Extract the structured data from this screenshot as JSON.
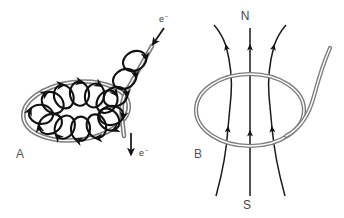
{
  "figure": {
    "width": 344,
    "height": 218,
    "background": "#ffffff"
  },
  "colors": {
    "wire": "#9a9a9a",
    "wire_edge": "#7d7d7d",
    "field_arrow": "#111111",
    "field_line": "#1a1a1a",
    "label": "#3a3a3a"
  },
  "panels": [
    {
      "id": "A",
      "label": "A",
      "label_x": 16,
      "label_y": 158,
      "caption_role": "current-loop-with-circular-magnetic-field",
      "wire": {
        "shape": "loop-with-diagonal-lead",
        "style": "double-line-tube",
        "color": "#9a9a9a"
      },
      "annotations": [
        {
          "name": "electron-inflow",
          "text": "e",
          "superscript": "−",
          "text_x": 160,
          "text_y": 22,
          "arrow": "diagonal-down-left",
          "arrow_from": [
            163,
            30
          ],
          "arrow_to": [
            152,
            45
          ]
        },
        {
          "name": "electron-outflow",
          "text": "e",
          "superscript": "−",
          "text_x": 141,
          "text_y": 156,
          "arrow": "straight-down",
          "arrow_from": [
            131,
            132
          ],
          "arrow_to": [
            131,
            155
          ]
        }
      ],
      "field_rings": {
        "count": 14,
        "style": "elliptical-arrow-loops-encircling-wire",
        "color": "#111111"
      }
    },
    {
      "id": "B",
      "label": "B",
      "label_x": 196,
      "label_y": 158,
      "caption_role": "equivalent-magnetic-dipole-field",
      "wire": {
        "shape": "ellipse-loop-with-lead",
        "style": "double-line-tube",
        "color": "#9a9a9a"
      },
      "poles": [
        {
          "name": "north-pole",
          "label": "N",
          "x": 250,
          "y": 20
        },
        {
          "name": "south-pole",
          "label": "S",
          "x": 250,
          "y": 208
        }
      ],
      "field_lines": {
        "count": 3,
        "direction": "upward",
        "color": "#1a1a1a",
        "arrowheads_per_line": 2
      }
    }
  ]
}
